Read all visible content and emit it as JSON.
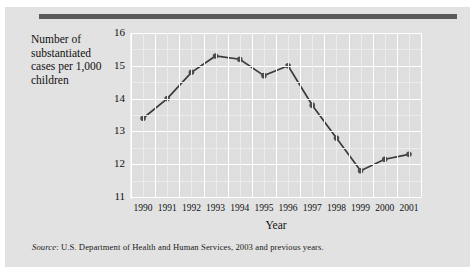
{
  "figure": {
    "y_axis_caption": "Number of substantiated cases per 1,000 children",
    "x_axis_title": "Year",
    "source_prefix": "Source",
    "source_text": ": U.S. Department of Health and Human Services, 2003 and previous years."
  },
  "style": {
    "panel_bg": "#e2e2e2",
    "plot_bg": "#dedede",
    "gridline": "#ffffff",
    "line_color": "#3a3a3a",
    "marker_color": "#4d4d4d",
    "rule_color": "#595959"
  },
  "chart_data": {
    "type": "line",
    "title": "",
    "xlabel": "Year",
    "ylabel": "Number of substantiated cases per 1,000 children",
    "categories": [
      "1990",
      "1991",
      "1992",
      "1993",
      "1994",
      "1995",
      "1996",
      "1997",
      "1998",
      "1999",
      "2000",
      "2001"
    ],
    "values": [
      13.4,
      14.0,
      14.8,
      15.3,
      15.2,
      14.7,
      15.0,
      13.8,
      12.8,
      11.8,
      12.15,
      12.3
    ],
    "x": [
      1990,
      1991,
      1992,
      1993,
      1994,
      1995,
      1996,
      1997,
      1998,
      1999,
      2000,
      2001
    ],
    "ylim": [
      11,
      16
    ],
    "xlim": [
      1990,
      2001
    ],
    "y_ticks": [
      16,
      15,
      14,
      13,
      12,
      11
    ],
    "y_tick_labels": [
      "16",
      "15",
      "14",
      "13",
      "12",
      "11"
    ],
    "y_minor_step": 0.5,
    "x_tick_labels": [
      "1990",
      "1991",
      "1992",
      "1993",
      "1994",
      "1995",
      "1996",
      "1997",
      "1998",
      "1999",
      "2000",
      "2001"
    ],
    "grid": true,
    "legend": "none",
    "markers": true,
    "source": "Source: U.S. Department of Health and Human Services, 2003 and previous years."
  }
}
